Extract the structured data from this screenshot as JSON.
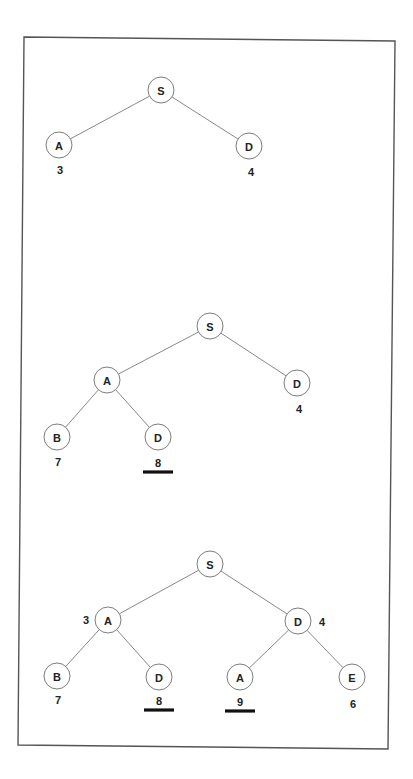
{
  "diagram": {
    "type": "search-tree-expansion",
    "frame": {
      "points": [
        [
          24,
          37
        ],
        [
          395,
          41
        ],
        [
          388,
          749
        ],
        [
          18,
          745
        ]
      ]
    },
    "node_radius": 13,
    "trees": [
      {
        "id": "tree-1",
        "nodes": [
          {
            "id": "t1-S",
            "label": "S",
            "x": 161,
            "y": 90
          },
          {
            "id": "t1-A",
            "label": "A",
            "x": 59,
            "y": 145
          },
          {
            "id": "t1-D",
            "label": "D",
            "x": 249,
            "y": 146
          }
        ],
        "edges": [
          [
            "t1-S",
            "t1-A"
          ],
          [
            "t1-S",
            "t1-D"
          ]
        ],
        "costs": [
          {
            "node": "t1-A",
            "value": "3",
            "x": 60,
            "y": 170,
            "underlined": false
          },
          {
            "node": "t1-D",
            "value": "4",
            "x": 251,
            "y": 172,
            "underlined": false
          }
        ]
      },
      {
        "id": "tree-2",
        "nodes": [
          {
            "id": "t2-S",
            "label": "S",
            "x": 210,
            "y": 326
          },
          {
            "id": "t2-A",
            "label": "A",
            "x": 107,
            "y": 380
          },
          {
            "id": "t2-D",
            "label": "D",
            "x": 297,
            "y": 383
          },
          {
            "id": "t2-B",
            "label": "B",
            "x": 57,
            "y": 437
          },
          {
            "id": "t2-D2",
            "label": "D",
            "x": 158,
            "y": 437
          }
        ],
        "edges": [
          [
            "t2-S",
            "t2-A"
          ],
          [
            "t2-S",
            "t2-D"
          ],
          [
            "t2-A",
            "t2-B"
          ],
          [
            "t2-A",
            "t2-D2"
          ]
        ],
        "costs": [
          {
            "node": "t2-D",
            "value": "4",
            "x": 299,
            "y": 409,
            "underlined": false
          },
          {
            "node": "t2-B",
            "value": "7",
            "x": 58,
            "y": 462,
            "underlined": false
          },
          {
            "node": "t2-D2",
            "value": "8",
            "x": 158,
            "y": 463,
            "underlined": true
          }
        ]
      },
      {
        "id": "tree-3",
        "nodes": [
          {
            "id": "t3-S",
            "label": "S",
            "x": 210,
            "y": 564
          },
          {
            "id": "t3-A",
            "label": "A",
            "x": 108,
            "y": 620
          },
          {
            "id": "t3-D",
            "label": "D",
            "x": 298,
            "y": 621
          },
          {
            "id": "t3-B",
            "label": "B",
            "x": 57,
            "y": 676
          },
          {
            "id": "t3-D2",
            "label": "D",
            "x": 159,
            "y": 677
          },
          {
            "id": "t3-A2",
            "label": "A",
            "x": 240,
            "y": 677
          },
          {
            "id": "t3-E",
            "label": "E",
            "x": 352,
            "y": 677
          }
        ],
        "edges": [
          [
            "t3-S",
            "t3-A"
          ],
          [
            "t3-S",
            "t3-D"
          ],
          [
            "t3-A",
            "t3-B"
          ],
          [
            "t3-A",
            "t3-D2"
          ],
          [
            "t3-D",
            "t3-A2"
          ],
          [
            "t3-D",
            "t3-E"
          ]
        ],
        "costs": [
          {
            "node": "t3-A",
            "value": "3",
            "x": 86,
            "y": 620,
            "underlined": false
          },
          {
            "node": "t3-D",
            "value": "4",
            "x": 322,
            "y": 622,
            "underlined": false
          },
          {
            "node": "t3-B",
            "value": "7",
            "x": 58,
            "y": 700,
            "underlined": false
          },
          {
            "node": "t3-D2",
            "value": "8",
            "x": 159,
            "y": 701,
            "underlined": true
          },
          {
            "node": "t3-A2",
            "value": "9",
            "x": 240,
            "y": 702,
            "underlined": true
          },
          {
            "node": "t3-E",
            "value": "6",
            "x": 353,
            "y": 704,
            "underlined": false
          }
        ]
      }
    ]
  }
}
